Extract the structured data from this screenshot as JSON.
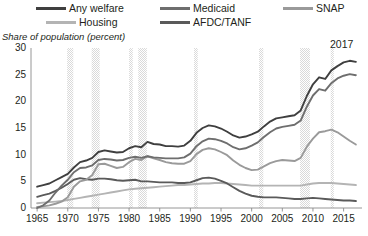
{
  "legend": {
    "items": [
      {
        "label": "Any welfare",
        "key": "any_welfare",
        "color": "#3f3f3f"
      },
      {
        "label": "Medicaid",
        "key": "medicaid",
        "color": "#6e6e6e"
      },
      {
        "label": "SNAP",
        "key": "snap",
        "color": "#9a9a9a"
      },
      {
        "label": "Housing",
        "key": "housing",
        "color": "#b4b4b4"
      },
      {
        "label": "AFDC/TANF",
        "key": "afdc_tanf",
        "color": "#5a5a5a"
      }
    ]
  },
  "axis_title": "Share of population (percent)",
  "annotation_end_year": "2017",
  "chart_data": {
    "type": "line",
    "title": "",
    "subtitle": "",
    "xlabel": "",
    "ylabel": "Share of population (percent)",
    "xlim": [
      1964,
      2018
    ],
    "ylim": [
      0,
      30
    ],
    "ytick_labels": [
      "0",
      "5",
      "10",
      "15",
      "20",
      "25",
      "30"
    ],
    "ytick_values": [
      0,
      5,
      10,
      15,
      20,
      25,
      30
    ],
    "xtick_labels": [
      "1965",
      "1970",
      "1975",
      "1980",
      "1985",
      "1990",
      "1995",
      "2000",
      "2005",
      "2010",
      "2015"
    ],
    "xtick_values": [
      1965,
      1970,
      1975,
      1980,
      1985,
      1990,
      1995,
      2000,
      2005,
      2010,
      2015
    ],
    "grid": false,
    "legend_position": "top",
    "annotations": [
      {
        "text": "2017",
        "x": 2017,
        "y": 29.5
      }
    ],
    "shaded_bands": [
      {
        "label": "recession",
        "x0": 1969.9,
        "x1": 1970.9
      },
      {
        "label": "recession",
        "x0": 1973.9,
        "x1": 1975.2
      },
      {
        "label": "recession",
        "x0": 1980.0,
        "x1": 1980.6
      },
      {
        "label": "recession",
        "x0": 1981.5,
        "x1": 1982.9
      },
      {
        "label": "recession",
        "x0": 1990.6,
        "x1": 1991.2
      },
      {
        "label": "recession",
        "x0": 2001.2,
        "x1": 2001.9
      },
      {
        "label": "recession",
        "x0": 2007.9,
        "x1": 2009.5
      },
      {
        "label": "recession",
        "x0": 2012.9,
        "x1": 2013.4
      }
    ],
    "band_color": "#d9d9d9",
    "x": [
      1965,
      1966,
      1967,
      1968,
      1969,
      1970,
      1971,
      1972,
      1973,
      1974,
      1975,
      1976,
      1977,
      1978,
      1979,
      1980,
      1981,
      1982,
      1983,
      1984,
      1985,
      1986,
      1987,
      1988,
      1989,
      1990,
      1991,
      1992,
      1993,
      1994,
      1995,
      1996,
      1997,
      1998,
      1999,
      2000,
      2001,
      2002,
      2003,
      2004,
      2005,
      2006,
      2007,
      2008,
      2009,
      2010,
      2011,
      2012,
      2013,
      2014,
      2015,
      2016,
      2017
    ],
    "series": [
      {
        "name": "Any welfare",
        "color": "#3f3f3f",
        "values": [
          4.0,
          4.3,
          4.6,
          5.2,
          5.8,
          6.4,
          7.6,
          8.6,
          8.9,
          9.4,
          10.5,
          10.8,
          10.6,
          10.4,
          10.5,
          11.2,
          11.6,
          11.4,
          12.4,
          12.0,
          11.9,
          11.6,
          11.6,
          11.5,
          11.7,
          12.6,
          14.1,
          15.0,
          15.5,
          15.3,
          14.9,
          14.3,
          13.6,
          13.2,
          13.4,
          13.8,
          14.3,
          15.3,
          16.2,
          16.8,
          17.0,
          17.2,
          17.4,
          18.3,
          21.0,
          23.2,
          24.5,
          24.2,
          25.8,
          26.6,
          27.3,
          27.6,
          27.4
        ]
      },
      {
        "name": "Medicaid",
        "color": "#6e6e6e",
        "values": [
          0.0,
          0.5,
          1.4,
          2.9,
          4.2,
          5.3,
          6.7,
          7.5,
          7.6,
          8.0,
          9.0,
          9.2,
          9.1,
          8.9,
          9.0,
          9.4,
          9.6,
          9.4,
          9.7,
          9.5,
          9.4,
          9.3,
          9.3,
          9.3,
          9.5,
          10.2,
          11.6,
          12.5,
          13.0,
          12.9,
          12.6,
          12.1,
          11.4,
          11.0,
          11.2,
          11.7,
          12.3,
          13.3,
          14.2,
          14.9,
          15.2,
          15.4,
          15.6,
          16.4,
          19.0,
          21.1,
          22.3,
          22.0,
          23.4,
          24.3,
          24.8,
          25.1,
          24.9
        ]
      },
      {
        "name": "SNAP",
        "color": "#9a9a9a",
        "values": [
          0.2,
          0.3,
          0.5,
          0.8,
          1.2,
          2.0,
          4.0,
          5.0,
          5.3,
          6.2,
          8.2,
          8.3,
          7.9,
          7.5,
          7.7,
          8.6,
          9.2,
          9.0,
          9.7,
          9.3,
          9.0,
          8.6,
          8.4,
          8.3,
          8.3,
          8.8,
          10.1,
          10.9,
          11.2,
          11.0,
          10.5,
          9.9,
          8.9,
          8.1,
          7.5,
          7.1,
          7.2,
          7.8,
          8.4,
          8.8,
          9.0,
          8.9,
          8.8,
          9.4,
          11.5,
          13.0,
          14.2,
          14.4,
          14.7,
          14.2,
          13.4,
          12.6,
          11.9
        ]
      },
      {
        "name": "Housing",
        "color": "#b4b4b4",
        "values": [
          0.9,
          1.0,
          1.1,
          1.2,
          1.3,
          1.5,
          1.7,
          1.9,
          2.1,
          2.3,
          2.5,
          2.7,
          2.9,
          3.1,
          3.3,
          3.5,
          3.6,
          3.7,
          3.8,
          3.9,
          4.0,
          4.1,
          4.2,
          4.3,
          4.3,
          4.4,
          4.5,
          4.6,
          4.6,
          4.7,
          4.7,
          4.6,
          4.5,
          4.4,
          4.3,
          4.2,
          4.2,
          4.2,
          4.2,
          4.2,
          4.2,
          4.2,
          4.2,
          4.2,
          4.4,
          4.6,
          4.7,
          4.7,
          4.7,
          4.6,
          4.5,
          4.4,
          4.3
        ]
      },
      {
        "name": "AFDC/TANF",
        "color": "#5a5a5a",
        "values": [
          2.1,
          2.4,
          2.7,
          3.2,
          3.8,
          4.5,
          5.3,
          5.6,
          5.4,
          5.3,
          5.5,
          5.5,
          5.4,
          5.2,
          5.1,
          5.2,
          5.3,
          5.0,
          5.0,
          4.9,
          4.8,
          4.8,
          4.8,
          4.7,
          4.7,
          4.8,
          5.2,
          5.6,
          5.7,
          5.5,
          5.1,
          4.6,
          3.9,
          3.2,
          2.7,
          2.3,
          2.1,
          2.0,
          2.0,
          2.0,
          1.9,
          1.8,
          1.7,
          1.7,
          1.8,
          1.9,
          1.8,
          1.7,
          1.6,
          1.5,
          1.4,
          1.4,
          1.3
        ]
      }
    ]
  }
}
